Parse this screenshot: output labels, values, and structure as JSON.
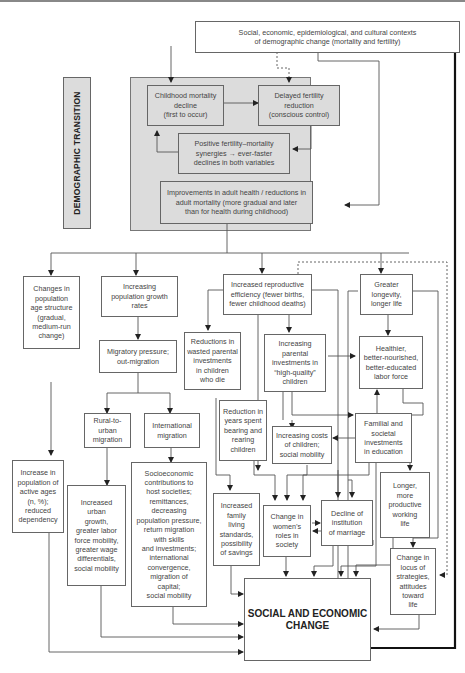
{
  "diagram": {
    "side_label": "DEMOGRAPHIC TRANSITION",
    "nodes": {
      "contexts": "Social, economic, epidemiological, and cultural contexts\nof demographic change (mortality and fertility)",
      "childhood_mortality": "Childhood mortality\ndecline\n(first to occur)",
      "delayed_fertility": "Delayed fertility\nreduction\n(conscious control)",
      "synergies": "Positive fertility–mortality\nsynergies → ever-faster\ndeclines in both variables",
      "adult_health": "Improvements in adult health / reductions in\nadult mortality (more gradual and later\nthan for health during childhood)",
      "age_structure": "Changes in\npopulation\nage structure\n(gradual,\nmedium-run\nchange)",
      "growth_rates": "Increasing\npopulation growth\nrates",
      "reproductive_efficiency": "Increased reproductive\nefficiency (fewer births,\nfewer childhood deaths)",
      "longevity": "Greater\nlongevity,\nlonger life",
      "migratory_pressure": "Migratory pressure;\nout-migration",
      "wasted_investments": "Reductions in\nwasted parental\ninvestments\nin children\nwho die",
      "parental_investments": "Increasing\nparental\ninvestments in\n“high-quality”\nchildren",
      "labor_force": "Healthier,\nbetter-nourished,\nbetter-educated\nlabor force",
      "rural_urban": "Rural-to-\nurban\nmigration",
      "international_migration": "International\nmigration",
      "years_bearing": "Reduction in\nyears spent\nbearing and\nrearing\nchildren",
      "costs_children": "Increasing costs\nof children;\nsocial mobility",
      "familial_investments": "Familial and\nsocietal\ninvestments\nin education",
      "active_ages": "Increase in\npopulation of\nactive ages\n(n, %);\nreduced\ndependency",
      "urban_growth": "Increased\nurban\ngrowth,\ngreater labor\nforce mobility,\ngreater wage\ndifferentials,\nsocial mobility",
      "socioeconomic_contributions": "Socioeconomic\ncontributions to\nhost societies;\nremittances,\ndecreasing\npopulation pressure,\nreturn migration\nwith skills\nand investments;\ninternational\nconvergence,\nmigration of\ncapital;\nsocial mobility",
      "living_standards": "Increased\nfamily\nliving\nstandards,\npossibility\nof savings",
      "womens_roles": "Change in\nwomen’s\nroles in\nsociety",
      "marriage": "Decline of\ninstitution\nof marriage",
      "working_life": "Longer,\nmore\nproductive\nworking\nlife",
      "locus_strategies": "Change in\nlocus of\nstrategies,\nattitudes\ntoward\nlife",
      "social_economic_change": "SOCIAL AND ECONOMIC\nCHANGE"
    }
  }
}
